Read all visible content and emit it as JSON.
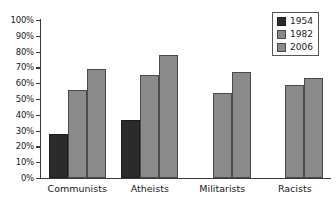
{
  "chart_data": {
    "type": "bar",
    "title": "",
    "subtitle": "",
    "xlabel": "",
    "ylabel": "",
    "ylim": [
      0,
      100
    ],
    "y_unit": "%",
    "grid": false,
    "legend_position": "top-right",
    "categories": [
      "Communists",
      "Atheists",
      "Militarists",
      "Racists"
    ],
    "y_tick_labels": [
      "100%",
      "90%",
      "80%",
      "70%",
      "60%",
      "50%",
      "40%",
      "30%",
      "20%",
      "10%",
      "0%"
    ],
    "y_tick_values": [
      100,
      90,
      80,
      70,
      60,
      50,
      40,
      30,
      20,
      10,
      0
    ],
    "series": [
      {
        "name": "1954",
        "color": "#2b2b2b",
        "values": [
          28,
          37,
          null,
          null
        ]
      },
      {
        "name": "1982",
        "color": "#8a8a8a",
        "values": [
          56,
          65,
          54,
          59
        ]
      },
      {
        "name": "2006",
        "color": "#8a8a8a",
        "values": [
          69,
          78,
          67,
          63
        ]
      }
    ]
  },
  "legend": {
    "entries": [
      {
        "label": "1954"
      },
      {
        "label": "1982"
      },
      {
        "label": "2006"
      }
    ]
  }
}
